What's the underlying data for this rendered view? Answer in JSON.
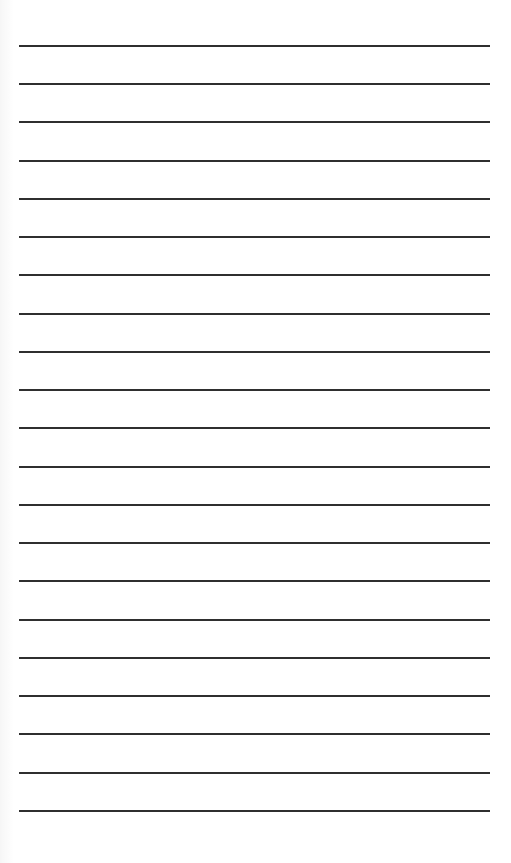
{
  "document": {
    "type": "ruled-paper",
    "line_count": 21,
    "line_color": "#2f2f2f",
    "background_color": "#ffffff",
    "lines": [
      {
        "y": 45
      },
      {
        "y": 83
      },
      {
        "y": 121
      },
      {
        "y": 160
      },
      {
        "y": 198
      },
      {
        "y": 236
      },
      {
        "y": 274
      },
      {
        "y": 313
      },
      {
        "y": 351
      },
      {
        "y": 389
      },
      {
        "y": 427
      },
      {
        "y": 466
      },
      {
        "y": 504
      },
      {
        "y": 542
      },
      {
        "y": 580
      },
      {
        "y": 619
      },
      {
        "y": 657
      },
      {
        "y": 695
      },
      {
        "y": 733
      },
      {
        "y": 772
      },
      {
        "y": 810
      }
    ]
  }
}
